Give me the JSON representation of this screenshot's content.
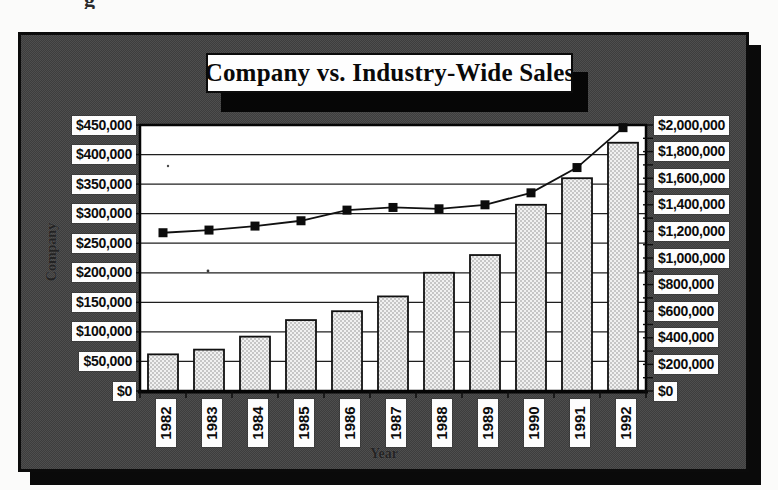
{
  "page": {
    "torn_text_fragment": "g"
  },
  "chart_data": {
    "type": "bar",
    "title": "Company vs. Industry-Wide Sales",
    "categories": [
      "1982",
      "1983",
      "1984",
      "1985",
      "1986",
      "1987",
      "1988",
      "1989",
      "1990",
      "1991",
      "1992"
    ],
    "series": [
      {
        "name": "Company",
        "render": "bar",
        "axis": "left",
        "values": [
          62000,
          70000,
          92000,
          120000,
          135000,
          160000,
          200000,
          230000,
          315000,
          360000,
          420000
        ]
      },
      {
        "name": "Industry-Wide",
        "render": "line",
        "axis": "right",
        "values": [
          1190000,
          1210000,
          1240000,
          1280000,
          1360000,
          1380000,
          1370000,
          1400000,
          1490000,
          1680000,
          1980000
        ]
      }
    ],
    "xlabel": "Year",
    "left_axis": {
      "title": "Company",
      "min": 0,
      "max": 450000,
      "step": 50000,
      "tick_labels": [
        "$0",
        "$50,000",
        "$100,000",
        "$150,000",
        "$200,000",
        "$250,000",
        "$300,000",
        "$350,000",
        "$400,000",
        "$450,000"
      ]
    },
    "right_axis": {
      "min": 0,
      "max": 2000000,
      "step": 200000,
      "minor_tick_step": 100000,
      "tick_labels": [
        "$0",
        "$200,000",
        "$400,000",
        "$600,000",
        "$800,000",
        "$1,000,000",
        "$1,200,000",
        "$1,400,000",
        "$1,600,000",
        "$1,800,000",
        "$2,000,000"
      ]
    },
    "grid": true,
    "legend": "none"
  },
  "colors": {
    "panel_gray": "#4e4e4e",
    "plot_background": "#ffffff",
    "bar_fill": "#f1f1f1",
    "bar_dot": "#8f8f8f",
    "ink": "#0c0c0c",
    "label_background": "#fdfdfd",
    "shadow": "#0a0a0a"
  }
}
